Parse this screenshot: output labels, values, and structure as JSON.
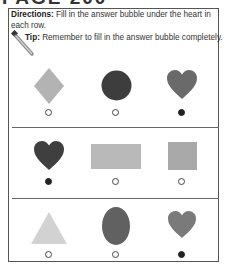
{
  "page_title_partial": "PAGE 200",
  "directions": {
    "label": "Directions:",
    "text": " Fill in the answer bubble under the heart in each row."
  },
  "tip": {
    "label": "Tip:",
    "text": " Remember to fill in the answer bubble completely."
  },
  "colors": {
    "border": "#555555",
    "light_gray": "#b8b8b8",
    "mid_gray": "#9e9e9e",
    "dark_gray": "#5e5e5e",
    "very_dark": "#3a3a3a",
    "pale_gray": "#cfcfcf"
  },
  "rows": [
    {
      "items": [
        {
          "shape": "diamond",
          "color": "#b3b3b3",
          "answer": false
        },
        {
          "shape": "circle",
          "color": "#3d3d3d",
          "answer": false
        },
        {
          "shape": "heart",
          "color": "#6a6a6a",
          "answer": true
        }
      ]
    },
    {
      "items": [
        {
          "shape": "heart",
          "color": "#3f3f3f",
          "answer": true
        },
        {
          "shape": "rectangle",
          "color": "#b9b9b9",
          "answer": false
        },
        {
          "shape": "square",
          "color": "#a9a9a9",
          "answer": false
        }
      ]
    },
    {
      "items": [
        {
          "shape": "triangle",
          "color": "#d2d2d2",
          "answer": false
        },
        {
          "shape": "oval",
          "color": "#616161",
          "answer": false
        },
        {
          "shape": "heart",
          "color": "#7a7a7a",
          "answer": true
        }
      ]
    }
  ]
}
